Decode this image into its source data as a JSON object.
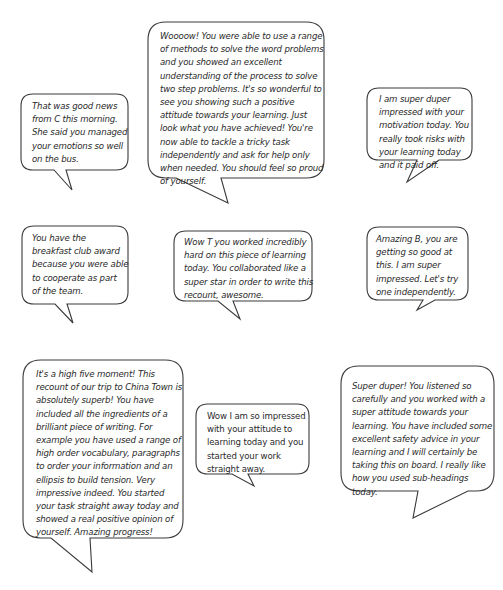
{
  "bubbles": [
    {
      "id": "top-center",
      "text": "Woooow! You were able to use a range\nof methods to solve the word problems\nand you showed an excellent\nunderstanding of the process to solve\ntwo step problems. It's so wonderful to\nsee you showing such a positive\nattitude towards your learning. Just\nlook what you have achieved! You're\nnow able to tackle a tricky task\nindependently and ask for help only\nwhen needed. You should feel so proud\nof yourself."
    },
    {
      "id": "top-left",
      "text": "That was good news\nfrom C this morning.\nShe said you managed\nyour emotions so well\non the bus."
    },
    {
      "id": "top-right",
      "text": "I am super duper\nimpressed with your\nmotivation today. You\nreally took risks with\nyour learning today\nand it paid off."
    },
    {
      "id": "middle-left",
      "text": "You have the\nbreakfast club award\nbecause you were able\nto cooperate as part\nof the team."
    },
    {
      "id": "middle-center",
      "text": "Wow T you worked incredibly\nhard on this piece of learning\ntoday. You collaborated like a\nsuper star in order to write this\nrecount, awesome."
    },
    {
      "id": "middle-right",
      "text": "Amazing B, you are\ngetting so good at\nthis. I am super\nimpressed. Let's try\none independently."
    },
    {
      "id": "bottom-left",
      "text": "It's a high five moment! This\nrecount of our trip to China Town is\nabsolutely superb! You have\nincluded all the ingredients of a\nbrilliant piece of writing. For\nexample you have used a range of\nhigh order vocabulary, paragraphs\nto order your information and an\nellipsis to build tension. Very\nimpressive indeed. You started\nyour task straight away today and\nshowed a real positive opinion of\nyourself. Amazing progress!"
    },
    {
      "id": "bottom-center",
      "text": "Wow I am so impressed\nwith your attitude to\nlearning today and you\nstarted your work\nstraight away."
    },
    {
      "id": "bottom-right",
      "text": "Super duper! You listened so\ncarefully and you worked with a\nsuper attitude towards your\nlearning. You have included some\nexcellent safety advice in your\nlearning and I will certainly be\ntaking this on board. I really like\nhow you used sub-headings today."
    }
  ]
}
